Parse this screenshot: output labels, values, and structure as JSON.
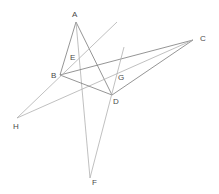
{
  "figure": {
    "type": "geometry-line-diagram",
    "width": 219,
    "height": 194,
    "background_color": "#ffffff",
    "line_color_dark": "#7a7a7a",
    "line_color_light": "#b0b0b0",
    "label_color": "#4a4a4a",
    "label_font_size_px": 8,
    "points": [
      {
        "id": "A",
        "label": "A",
        "x": 76,
        "y": 22,
        "label_x": 72,
        "label_y": 11
      },
      {
        "id": "B",
        "label": "B",
        "x": 60,
        "y": 75,
        "label_x": 51,
        "label_y": 72
      },
      {
        "id": "C",
        "label": "C",
        "x": 193,
        "y": 40,
        "label_x": 200,
        "label_y": 35
      },
      {
        "id": "D",
        "label": "D",
        "x": 112,
        "y": 95,
        "label_x": 113,
        "label_y": 98
      },
      {
        "id": "E",
        "label": "E",
        "x": 70,
        "y": 63,
        "label_x": 70,
        "label_y": 54
      },
      {
        "id": "F",
        "label": "F",
        "x": 90,
        "y": 178,
        "label_x": 92,
        "label_y": 179
      },
      {
        "id": "G",
        "label": "G",
        "x": 116,
        "y": 76,
        "label_x": 118,
        "label_y": 74
      },
      {
        "id": "H",
        "label": "H",
        "x": 17,
        "y": 118,
        "label_x": 13,
        "label_y": 123
      }
    ],
    "segments": [
      {
        "name": "segment-A-B",
        "from": "A",
        "to": "B",
        "shade": "dark"
      },
      {
        "name": "segment-A-D",
        "from": "A",
        "to": "D",
        "shade": "dark"
      },
      {
        "name": "segment-A-F",
        "from": "A",
        "to": "F",
        "shade": "light"
      },
      {
        "name": "segment-B-C",
        "from": "B",
        "to": "C",
        "shade": "dark"
      },
      {
        "name": "segment-D-C",
        "from": "D",
        "to": "C",
        "shade": "dark"
      },
      {
        "name": "segment-H-C",
        "from": "H",
        "to": "C",
        "shade": "light"
      },
      {
        "name": "segment-B-D",
        "from": "B",
        "to": "D",
        "shade": "dark"
      },
      {
        "name": "segment-H-E-ext",
        "from": "H",
        "to": "ext1",
        "shade": "light"
      },
      {
        "name": "segment-F-ext",
        "from": "F",
        "to": "ext2",
        "shade": "light"
      }
    ],
    "extension_endpoints": [
      {
        "id": "ext1",
        "x": 117,
        "y": 22
      },
      {
        "id": "ext2",
        "x": 124,
        "y": 47
      }
    ]
  }
}
